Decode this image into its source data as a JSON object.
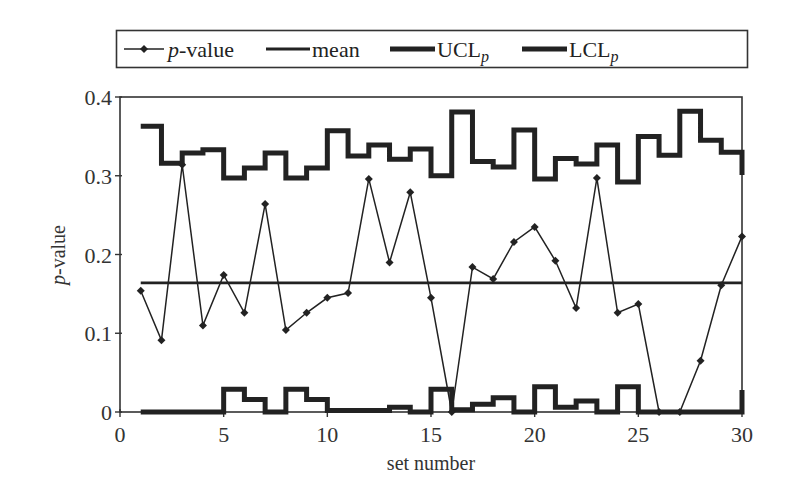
{
  "chart_data": {
    "type": "line",
    "title": "",
    "xlabel": "set number",
    "ylabel": "p-value",
    "ylabel_italic_part": "p",
    "ylabel_rest": "-value",
    "xlim": [
      0,
      30
    ],
    "ylim": [
      0,
      0.4
    ],
    "x_ticks": [
      0,
      5,
      10,
      15,
      20,
      25,
      30
    ],
    "y_ticks": [
      0,
      0.1,
      0.2,
      0.3,
      0.4
    ],
    "y_tick_labels": [
      "0",
      "0.1",
      "0.2",
      "0.3",
      "0.4"
    ],
    "grid": false,
    "legend_position": "top, outside plot, boxed",
    "legend": [
      {
        "name": "p-value",
        "italic": "p",
        "rest": "-value",
        "style": "thin line with diamond markers"
      },
      {
        "name": "mean",
        "italic": "",
        "rest": "mean",
        "style": "medium solid line"
      },
      {
        "name": "UCLp",
        "main": "UCL",
        "sub": "p",
        "style": "thick step line"
      },
      {
        "name": "LCLp",
        "main": "LCL",
        "sub": "p",
        "style": "thick step line"
      }
    ],
    "x": [
      1,
      2,
      3,
      4,
      5,
      6,
      7,
      8,
      9,
      10,
      11,
      12,
      13,
      14,
      15,
      16,
      17,
      18,
      19,
      20,
      21,
      22,
      23,
      24,
      25,
      26,
      27,
      28,
      29,
      30
    ],
    "series": [
      {
        "name": "p-value",
        "values": [
          0.154,
          0.091,
          0.314,
          0.11,
          0.174,
          0.126,
          0.264,
          0.104,
          0.126,
          0.145,
          0.151,
          0.296,
          0.19,
          0.279,
          0.145,
          0.0,
          0.184,
          0.169,
          0.216,
          0.235,
          0.192,
          0.132,
          0.297,
          0.126,
          0.137,
          0.0,
          0.0,
          0.065,
          0.161,
          0.223
        ]
      },
      {
        "name": "mean",
        "values": [
          0.164,
          0.164,
          0.164,
          0.164,
          0.164,
          0.164,
          0.164,
          0.164,
          0.164,
          0.164,
          0.164,
          0.164,
          0.164,
          0.164,
          0.164,
          0.164,
          0.164,
          0.164,
          0.164,
          0.164,
          0.164,
          0.164,
          0.164,
          0.164,
          0.164,
          0.164,
          0.164,
          0.164,
          0.164,
          0.164
        ]
      },
      {
        "name": "UCLp",
        "values": [
          0.363,
          0.316,
          0.329,
          0.333,
          0.297,
          0.31,
          0.329,
          0.297,
          0.31,
          0.357,
          0.325,
          0.339,
          0.321,
          0.334,
          0.3,
          0.381,
          0.318,
          0.311,
          0.358,
          0.296,
          0.322,
          0.315,
          0.339,
          0.292,
          0.35,
          0.326,
          0.382,
          0.345,
          0.33,
          0.301
        ]
      },
      {
        "name": "LCLp",
        "values": [
          0.0,
          0.0,
          0.0,
          0.0,
          0.029,
          0.016,
          0.0,
          0.029,
          0.016,
          0.002,
          0.002,
          0.002,
          0.006,
          0.0,
          0.029,
          0.003,
          0.01,
          0.018,
          0.0,
          0.032,
          0.006,
          0.014,
          0.0,
          0.032,
          0.0,
          0.0,
          0.0,
          0.0,
          0.0,
          0.028
        ]
      }
    ]
  }
}
